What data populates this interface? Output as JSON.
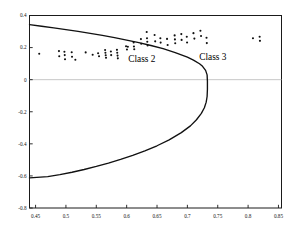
{
  "figure": {
    "background_color": "#ffffff",
    "axis_color": "#1a1a1a",
    "curve_color": "#111111",
    "point_color": "#101010",
    "zero_line_color": "#b9b9b9"
  },
  "annotations": {
    "class2_label": "Class 2",
    "class3_label": "Class 3"
  },
  "chart_data": {
    "type": "scatter",
    "title": "",
    "xlabel": "",
    "ylabel": "",
    "xlim": [
      0.44,
      0.855
    ],
    "ylim": [
      -0.8,
      0.4
    ],
    "grid": false,
    "legend": "none",
    "xticks": [
      0.45,
      0.5,
      0.55,
      0.6,
      0.65,
      0.7,
      0.75,
      0.8,
      0.85
    ],
    "xticklabels": [
      "0.45",
      "0.5",
      "0.55",
      "0.6",
      "0.65",
      "0.7",
      "0.75",
      "0.8",
      "0.85"
    ],
    "yticks": [
      0.4,
      0.2,
      0,
      -0.2,
      -0.4,
      -0.6,
      -0.8
    ],
    "yticklabels": [
      "0.4",
      "0.2",
      "0",
      "-0.2",
      "-0.4",
      "-0.6",
      "-0.8"
    ],
    "reference_lines": [
      {
        "name": "zero-line",
        "orientation": "horizontal",
        "y": 0,
        "color": "#b9b9b9"
      }
    ],
    "annotations": [
      {
        "text": "Class 2",
        "x": 0.625,
        "y": 0.113
      },
      {
        "text": "Class 3",
        "x": 0.742,
        "y": 0.125
      }
    ],
    "curves": [
      {
        "name": "decision-boundary-parabola",
        "shape": "leftward-opening parabola",
        "vertex": [
          0.733,
          -0.152
        ],
        "upper_branch_endpoint": [
          0.44,
          0.343
        ],
        "lower_branch_endpoint": [
          0.44,
          -0.612
        ],
        "points": [
          [
            0.44,
            0.343
          ],
          [
            0.46,
            0.333
          ],
          [
            0.48,
            0.323
          ],
          [
            0.5,
            0.312
          ],
          [
            0.52,
            0.301
          ],
          [
            0.54,
            0.289
          ],
          [
            0.56,
            0.276
          ],
          [
            0.58,
            0.262
          ],
          [
            0.6,
            0.247
          ],
          [
            0.62,
            0.231
          ],
          [
            0.64,
            0.213
          ],
          [
            0.66,
            0.193
          ],
          [
            0.68,
            0.169
          ],
          [
            0.7,
            0.14
          ],
          [
            0.71,
            0.122
          ],
          [
            0.72,
            0.099
          ],
          [
            0.725,
            0.083
          ],
          [
            0.73,
            0.058
          ],
          [
            0.7325,
            0.03
          ],
          [
            0.733,
            -0.01
          ],
          [
            0.733,
            -0.06
          ],
          [
            0.7325,
            -0.105
          ],
          [
            0.731,
            -0.14
          ],
          [
            0.728,
            -0.175
          ],
          [
            0.723,
            -0.21
          ],
          [
            0.715,
            -0.25
          ],
          [
            0.705,
            -0.288
          ],
          [
            0.69,
            -0.33
          ],
          [
            0.67,
            -0.375
          ],
          [
            0.65,
            -0.412
          ],
          [
            0.63,
            -0.444
          ],
          [
            0.61,
            -0.472
          ],
          [
            0.59,
            -0.497
          ],
          [
            0.57,
            -0.52
          ],
          [
            0.55,
            -0.541
          ],
          [
            0.53,
            -0.56
          ],
          [
            0.51,
            -0.577
          ],
          [
            0.49,
            -0.592
          ],
          [
            0.47,
            -0.604
          ],
          [
            0.44,
            -0.612
          ]
        ]
      }
    ],
    "series": [
      {
        "name": "Class 2",
        "marker": "dot",
        "points": [
          [
            0.456,
            0.162
          ],
          [
            0.4885,
            0.178
          ],
          [
            0.489,
            0.146
          ],
          [
            0.4975,
            0.174
          ],
          [
            0.498,
            0.153
          ],
          [
            0.4985,
            0.127
          ],
          [
            0.5095,
            0.171
          ],
          [
            0.51,
            0.143
          ],
          [
            0.5155,
            0.124
          ],
          [
            0.5325,
            0.17
          ],
          [
            0.544,
            0.155
          ],
          [
            0.553,
            0.165
          ],
          [
            0.5545,
            0.146
          ],
          [
            0.5645,
            0.185
          ],
          [
            0.565,
            0.168
          ],
          [
            0.5655,
            0.152
          ],
          [
            0.566,
            0.137
          ],
          [
            0.574,
            0.176
          ],
          [
            0.5745,
            0.153
          ],
          [
            0.584,
            0.186
          ],
          [
            0.5845,
            0.168
          ],
          [
            0.585,
            0.15
          ],
          [
            0.5855,
            0.133
          ],
          [
            0.599,
            0.208
          ],
          [
            0.6005,
            0.188
          ],
          [
            0.602,
            0.205
          ]
        ]
      },
      {
        "name": "Class 3",
        "marker": "dot",
        "points": [
          [
            0.6115,
            0.232
          ],
          [
            0.612,
            0.207
          ],
          [
            0.6125,
            0.19
          ],
          [
            0.6235,
            0.253
          ],
          [
            0.624,
            0.224
          ],
          [
            0.633,
            0.297
          ],
          [
            0.6335,
            0.258
          ],
          [
            0.634,
            0.236
          ],
          [
            0.6345,
            0.213
          ],
          [
            0.646,
            0.278
          ],
          [
            0.647,
            0.239
          ],
          [
            0.6555,
            0.258
          ],
          [
            0.656,
            0.231
          ],
          [
            0.6665,
            0.254
          ],
          [
            0.6675,
            0.216
          ],
          [
            0.679,
            0.276
          ],
          [
            0.6795,
            0.251
          ],
          [
            0.68,
            0.227
          ],
          [
            0.69,
            0.284
          ],
          [
            0.6905,
            0.248
          ],
          [
            0.699,
            0.268
          ],
          [
            0.6995,
            0.232
          ],
          [
            0.71,
            0.29
          ],
          [
            0.7115,
            0.256
          ],
          [
            0.7215,
            0.305
          ],
          [
            0.7225,
            0.272
          ],
          [
            0.7315,
            0.261
          ],
          [
            0.732,
            0.228
          ],
          [
            0.808,
            0.258
          ],
          [
            0.819,
            0.268
          ],
          [
            0.8195,
            0.242
          ]
        ]
      }
    ]
  }
}
